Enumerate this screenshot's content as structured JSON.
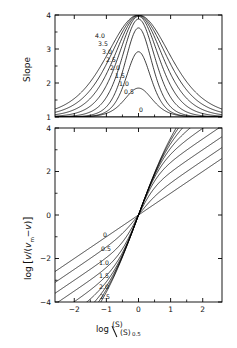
{
  "figure": {
    "title": "",
    "background": "#ffffff",
    "line_color": "#000000",
    "width": 237,
    "height": 348
  },
  "panels": [
    {
      "id": "top",
      "ylabel": "Slope",
      "xlabel": "",
      "yticks": [
        1,
        2,
        3,
        4
      ],
      "ytick_labels": [
        "1",
        "2",
        "3",
        "4"
      ],
      "xticks": [
        -2,
        -1,
        0,
        1,
        2
      ],
      "xtick_labels": [
        "",
        "",
        "",
        "",
        ""
      ],
      "ylim": [
        1,
        4
      ],
      "xlim": [
        -2.6,
        2.6
      ],
      "curve_labels": [
        "4.0",
        "3.5",
        "3.0",
        "2.5",
        "2.0",
        "1.5",
        "1.0",
        "0.5",
        "0"
      ],
      "zero_label": "0"
    },
    {
      "id": "bottom",
      "ylabel": "log [ v/(vm−v) ]",
      "ylabel_parts": {
        "log": "log",
        "bracket_open": "[",
        "numerator": "v",
        "denominator_m": "v",
        "denominator_sub": "m",
        "minus": "−",
        "denominator_v": "v",
        "bracket_close": "]"
      },
      "xlabel": "log (S)/(S)0.5",
      "xlabel_parts": {
        "log": "log",
        "numerator": "(S)",
        "denominator": "(S)",
        "subscript": "0.5"
      },
      "yticks": [
        -4,
        -2,
        0,
        2,
        4
      ],
      "ytick_labels": [
        "−4",
        "−2",
        "0",
        "2",
        "4"
      ],
      "xticks": [
        -2,
        -1,
        0,
        1,
        2
      ],
      "xtick_labels": [
        "−2",
        "−1",
        "0",
        "1",
        "2"
      ],
      "ylim": [
        -4,
        4
      ],
      "xlim": [
        -2.6,
        2.6
      ],
      "curve_labels": [
        "0",
        "0.5",
        "1.0",
        "1.5",
        "2.0",
        "2.5"
      ]
    }
  ],
  "chart_data": {
    "type": "line",
    "title": "",
    "n_panels": 2,
    "shared_x": {
      "label": "log (S)/(S)0.5",
      "range": [
        -2.6,
        2.6
      ],
      "ticks": [
        -2,
        -1,
        0,
        1,
        2
      ]
    },
    "panel_top": {
      "type": "line",
      "ylabel": "Slope",
      "ylim": [
        1,
        4
      ],
      "yticks": [
        1,
        2,
        3,
        4
      ],
      "grid": false,
      "legend": "inline-curve-labels",
      "description": "Slope of the Hill plot versus log relative substrate concentration; symmetric peaked curves rising from a baseline of 1 to a maximum of 4 as the cooperativity parameter increases.",
      "series": [
        {
          "name": "0",
          "param": 0.0,
          "peak_slope": 1.0,
          "peak_x": 0.0,
          "baseline": 1.0
        },
        {
          "name": "0.5",
          "param": 0.5,
          "peak_slope": 1.85,
          "peak_x": 0.0,
          "baseline": 1.0
        },
        {
          "name": "1.0",
          "param": 1.0,
          "peak_slope": 2.92,
          "peak_x": 0.0,
          "baseline": 1.0
        },
        {
          "name": "1.5",
          "param": 1.5,
          "peak_slope": 3.62,
          "peak_x": 0.0,
          "baseline": 1.0
        },
        {
          "name": "2.0",
          "param": 2.0,
          "peak_slope": 3.88,
          "peak_x": 0.0,
          "baseline": 1.0
        },
        {
          "name": "2.5",
          "param": 2.5,
          "peak_slope": 3.96,
          "peak_x": 0.0,
          "baseline": 1.0
        },
        {
          "name": "3.0",
          "param": 3.0,
          "peak_slope": 3.98,
          "peak_x": 0.0,
          "baseline": 1.0
        },
        {
          "name": "3.5",
          "param": 3.5,
          "peak_slope": 3.99,
          "peak_x": 0.0,
          "baseline": 1.0
        },
        {
          "name": "4.0",
          "param": 4.0,
          "peak_slope": 4.0,
          "peak_x": 0.0,
          "baseline": 1.0
        }
      ]
    },
    "panel_bottom": {
      "type": "line",
      "ylabel": "log [ v/(vm-v) ]",
      "ylim": [
        -4,
        4
      ],
      "yticks": [
        -4,
        -2,
        0,
        2,
        4
      ],
      "grid": false,
      "legend": "inline-curve-labels",
      "description": "Hill plots: log[v/(vm-v)] versus log relative substrate concentration. All curves pass through the origin; asymptotic slope is 1 far from the origin and steepens near the origin as the cooperativity parameter increases.",
      "series": [
        {
          "name": "0",
          "param": 0.0,
          "slope_at_origin": 1.0,
          "through": [
            0,
            0
          ]
        },
        {
          "name": "0.5",
          "param": 0.5,
          "slope_at_origin": 1.85,
          "through": [
            0,
            0
          ]
        },
        {
          "name": "1.0",
          "param": 1.0,
          "slope_at_origin": 2.92,
          "through": [
            0,
            0
          ]
        },
        {
          "name": "1.5",
          "param": 1.5,
          "slope_at_origin": 3.62,
          "through": [
            0,
            0
          ]
        },
        {
          "name": "2.0",
          "param": 2.0,
          "slope_at_origin": 3.88,
          "through": [
            0,
            0
          ]
        },
        {
          "name": "2.5",
          "param": 2.5,
          "slope_at_origin": 3.96,
          "through": [
            0,
            0
          ]
        },
        {
          "name": "3.0",
          "param": 3.0,
          "slope_at_origin": 3.98,
          "through": [
            0,
            0
          ]
        },
        {
          "name": "3.5",
          "param": 3.5,
          "slope_at_origin": 3.99,
          "through": [
            0,
            0
          ]
        },
        {
          "name": "4.0",
          "param": 4.0,
          "slope_at_origin": 4.0,
          "through": [
            0,
            0
          ]
        }
      ]
    }
  }
}
